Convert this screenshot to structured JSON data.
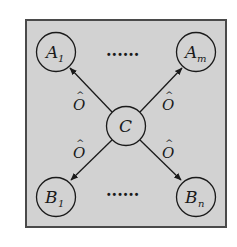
{
  "diagram": {
    "type": "star-topology",
    "colors": {
      "background": "#d2d2d2",
      "border": "#4a4a4a",
      "stroke": "#1a1a1a",
      "node_fill": "#d2d2d2"
    },
    "center_node": {
      "id": "C",
      "label": "C",
      "subscript": ""
    },
    "top_nodes": [
      {
        "id": "A1",
        "label": "A",
        "subscript": "1"
      },
      {
        "id": "Am",
        "label": "A",
        "subscript": "m"
      }
    ],
    "bottom_nodes": [
      {
        "id": "B1",
        "label": "B",
        "subscript": "1"
      },
      {
        "id": "Bn",
        "label": "B",
        "subscript": "n"
      }
    ],
    "ellipsis_top": "......",
    "ellipsis_bottom": "......",
    "edges": [
      {
        "from": "C",
        "to": "A1",
        "label": "O",
        "hat": "^",
        "direction": "outward"
      },
      {
        "from": "C",
        "to": "Am",
        "label": "O",
        "hat": "^",
        "direction": "outward"
      },
      {
        "from": "C",
        "to": "B1",
        "label": "O",
        "hat": "^",
        "direction": "outward"
      },
      {
        "from": "C",
        "to": "Bn",
        "label": "O",
        "hat": "^",
        "direction": "outward"
      }
    ]
  }
}
